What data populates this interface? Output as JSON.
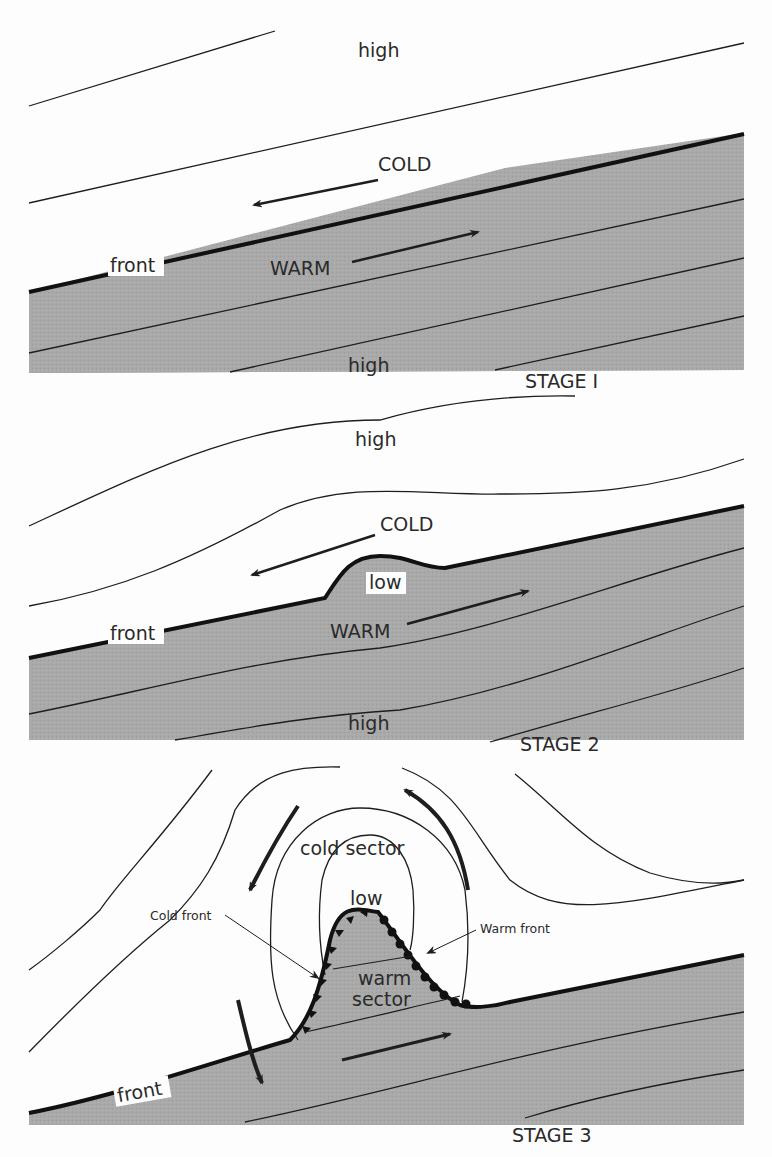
{
  "colors": {
    "warm_air": "#a9a9a9",
    "line": "#1e1e1e",
    "background": "#fdfdfd"
  },
  "stage1": {
    "label": "STAGE I",
    "high_top": "high",
    "cold": "COLD",
    "warm": "WARM",
    "front": "front",
    "high_bottom": "high"
  },
  "stage2": {
    "label": "STAGE 2",
    "high_top": "high",
    "cold": "COLD",
    "low": "low",
    "warm": "WARM",
    "front": "front",
    "high_bottom": "high"
  },
  "stage3": {
    "label": "STAGE 3",
    "cold_sector": "cold  sector",
    "low": "low",
    "cold_front": "Cold front",
    "warm_front": "Warm front",
    "warm_sector_1": "warm",
    "warm_sector_2": "sector",
    "front": "front"
  }
}
